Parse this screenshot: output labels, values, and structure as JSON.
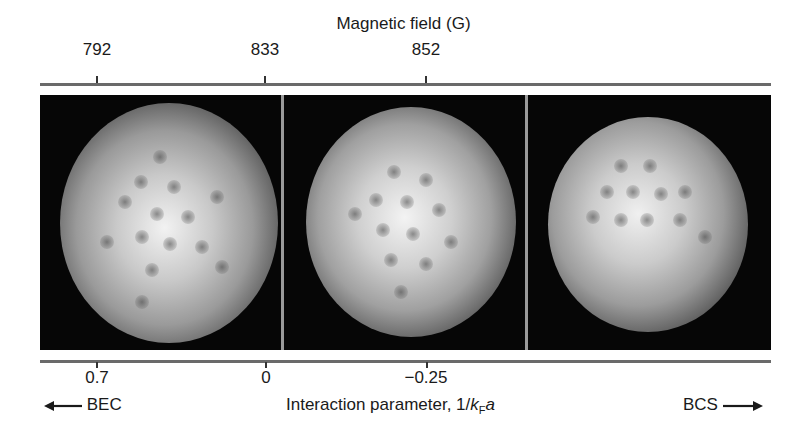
{
  "figure": {
    "top_axis": {
      "title": "Magnetic field (G)",
      "ticks": [
        "792",
        "833",
        "852"
      ]
    },
    "bottom_axis": {
      "ticks": [
        "0.7",
        "0",
        "−0.25"
      ],
      "label_prefix": "Interaction parameter, 1/",
      "label_k": "k",
      "label_sub": "F",
      "label_a": "a",
      "left_regime": "BEC",
      "right_regime": "BCS",
      "left_arrow_icon": "arrow-left-icon",
      "right_arrow_icon": "arrow-right-icon"
    },
    "panels": [
      {
        "field_G": "792",
        "interaction": "0.7",
        "description": "Vortex lattice in BEC-side superfluid cloud"
      },
      {
        "field_G": "833",
        "interaction": "0",
        "description": "Vortex lattice at unitarity"
      },
      {
        "field_G": "852",
        "interaction": "−0.25",
        "description": "Vortex lattice in BCS-side superfluid cloud"
      }
    ],
    "colors": {
      "background": "#ffffff",
      "image_background": "#050505",
      "divider": "#9a9a9a",
      "axis_line": "#6a6a6a",
      "text": "#1a1a1a"
    }
  }
}
